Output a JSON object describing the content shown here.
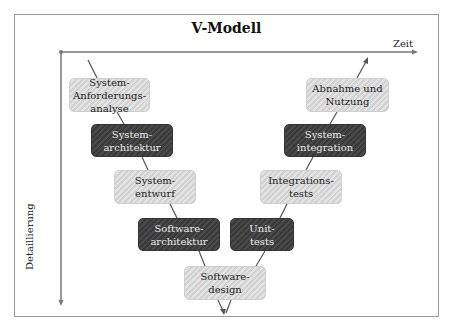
{
  "diagram": {
    "title": "V-Modell",
    "x_axis_label": "Zeit",
    "y_axis_label": "Detaillierung",
    "left_branch": [
      {
        "label": "System-\nAnforderungs-\nanalyse",
        "style": "light"
      },
      {
        "label": "System-\narchitektur",
        "style": "dark"
      },
      {
        "label": "System-\nentwurf",
        "style": "light"
      },
      {
        "label": "Software-\narchitektur",
        "style": "dark"
      }
    ],
    "bottom": {
      "label": "Software-\ndesign",
      "style": "light"
    },
    "right_branch": [
      {
        "label": "Unit-\ntests",
        "style": "dark"
      },
      {
        "label": "Integrations-\ntests",
        "style": "light"
      },
      {
        "label": "System-\nintegration",
        "style": "dark"
      },
      {
        "label": "Abnahme und\nNutzung",
        "style": "light"
      }
    ],
    "colors": {
      "light_box": "#d9d9d9",
      "dark_box": "#404040",
      "axis": "#777777"
    }
  }
}
